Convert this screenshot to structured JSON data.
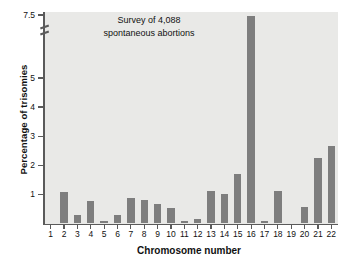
{
  "chart_data": {
    "type": "bar",
    "title": "",
    "annotation": [
      "Survey of 4,088",
      "spontaneous abortions"
    ],
    "xlabel": "Chromosome number",
    "ylabel": "Percentage of trisomies",
    "categories": [
      "1",
      "2",
      "3",
      "4",
      "5",
      "6",
      "7",
      "8",
      "9",
      "10",
      "11",
      "12",
      "13",
      "14",
      "15",
      "16",
      "17",
      "18",
      "19",
      "20",
      "21",
      "22"
    ],
    "values": [
      0.0,
      1.08,
      0.28,
      0.77,
      0.1,
      0.28,
      0.87,
      0.8,
      0.68,
      0.52,
      0.1,
      0.16,
      1.12,
      1.0,
      1.7,
      7.48,
      0.08,
      1.1,
      0.0,
      0.55,
      2.26,
      2.68
    ],
    "ytick_labels": [
      "1",
      "2",
      "3",
      "4",
      "5",
      "7.5"
    ],
    "ytick_values": [
      1,
      2,
      3,
      4,
      5,
      7.5
    ],
    "ylim": [
      0,
      7.5
    ],
    "axis_break": {
      "between": [
        5,
        7.5
      ],
      "present": true
    },
    "grid": false,
    "legend": "none",
    "bar_color": "#7e7e7e",
    "plot_background": "#e9e9e7",
    "axis_color": "#5a5a5a",
    "text_color": "#111111"
  }
}
